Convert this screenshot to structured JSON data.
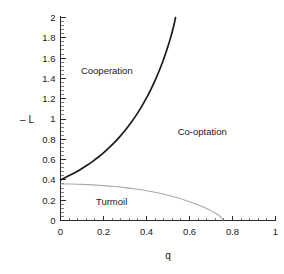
{
  "chart_data": {
    "type": "line",
    "title": "",
    "subtitle": "",
    "xlabel": "q",
    "ylabel": "– L",
    "xlim": [
      0,
      1
    ],
    "ylim": [
      0,
      2
    ],
    "grid": false,
    "legend_position": "none",
    "x_ticks": [
      0,
      0.2,
      0.4,
      0.6,
      0.8,
      1
    ],
    "x_tick_labels": [
      "0",
      "0.2",
      "0.4",
      "0.6",
      "0.8",
      "1"
    ],
    "x_minor_per_major": 5,
    "y_ticks": [
      0,
      0.2,
      0.4,
      0.6,
      0.8,
      1,
      1.2,
      1.4,
      1.6,
      1.8,
      2
    ],
    "y_tick_labels": [
      "0",
      "0.2",
      "0.4",
      "0.6",
      "0.8",
      "1",
      "1.2",
      "1.4",
      "1.6",
      "1.8",
      "2"
    ],
    "y_minor_per_major": 5,
    "series": [
      {
        "name": "cooperation-boundary",
        "color": "#1b1b1b",
        "width": 1.7,
        "points": [
          [
            0.0,
            0.4
          ],
          [
            0.025,
            0.425
          ],
          [
            0.05,
            0.452
          ],
          [
            0.075,
            0.481
          ],
          [
            0.1,
            0.512
          ],
          [
            0.125,
            0.546
          ],
          [
            0.15,
            0.583
          ],
          [
            0.175,
            0.623
          ],
          [
            0.2,
            0.667
          ],
          [
            0.225,
            0.715
          ],
          [
            0.25,
            0.767
          ],
          [
            0.275,
            0.824
          ],
          [
            0.3,
            0.886
          ],
          [
            0.325,
            0.955
          ],
          [
            0.35,
            1.031
          ],
          [
            0.375,
            1.115
          ],
          [
            0.4,
            1.208
          ],
          [
            0.42,
            1.29
          ],
          [
            0.44,
            1.38
          ],
          [
            0.46,
            1.48
          ],
          [
            0.475,
            1.562
          ],
          [
            0.49,
            1.652
          ],
          [
            0.5,
            1.717
          ],
          [
            0.51,
            1.787
          ],
          [
            0.52,
            1.862
          ],
          [
            0.528,
            1.928
          ],
          [
            0.535,
            2.0
          ]
        ]
      },
      {
        "name": "turmoil-boundary",
        "color": "#a9a9a9",
        "width": 1.1,
        "points": [
          [
            0.0,
            0.36
          ],
          [
            0.05,
            0.359
          ],
          [
            0.1,
            0.356
          ],
          [
            0.15,
            0.351
          ],
          [
            0.2,
            0.344
          ],
          [
            0.25,
            0.335
          ],
          [
            0.3,
            0.324
          ],
          [
            0.35,
            0.31
          ],
          [
            0.4,
            0.293
          ],
          [
            0.45,
            0.273
          ],
          [
            0.5,
            0.249
          ],
          [
            0.54,
            0.226
          ],
          [
            0.58,
            0.2
          ],
          [
            0.62,
            0.17
          ],
          [
            0.65,
            0.145
          ],
          [
            0.68,
            0.117
          ],
          [
            0.705,
            0.09
          ],
          [
            0.725,
            0.066
          ],
          [
            0.74,
            0.044
          ],
          [
            0.75,
            0.024
          ],
          [
            0.755,
            0.0
          ]
        ]
      }
    ],
    "annotations": [
      {
        "text": "Cooperation",
        "x": 0.095,
        "y": 1.44,
        "anchor": "start"
      },
      {
        "text": "Co-optation",
        "x": 0.545,
        "y": 0.845,
        "anchor": "start"
      },
      {
        "text": "Turmoil",
        "x": 0.165,
        "y": 0.155,
        "anchor": "start"
      }
    ]
  },
  "colors": {
    "axis": "#2b2b2b",
    "primary_curve": "#1b1b1b",
    "secondary_curve": "#a9a9a9",
    "text": "#1a1a1a",
    "background": "#ffffff"
  }
}
